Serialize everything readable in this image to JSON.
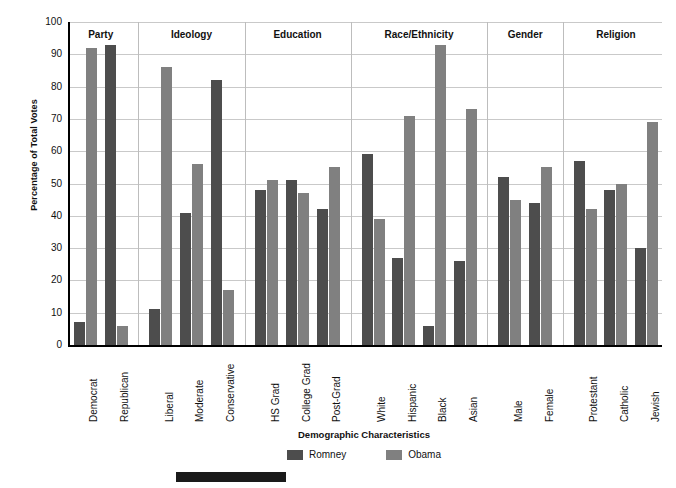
{
  "chart_data": {
    "type": "bar",
    "title": "",
    "xlabel": "Demographic Characteristics",
    "ylabel": "Percentage of Total Votes",
    "ylim": [
      0,
      100
    ],
    "ytick_step": 10,
    "yticks": [
      100,
      90,
      80,
      70,
      60,
      50,
      40,
      30,
      20,
      10,
      0
    ],
    "grid": true,
    "legend_position": "bottom-center",
    "series": [
      {
        "name": "Romney",
        "color": "#4d4d4d",
        "values": [
          7,
          93,
          11,
          41,
          82,
          48,
          51,
          42,
          59,
          27,
          6,
          26,
          52,
          44,
          57,
          48,
          30
        ]
      },
      {
        "name": "Obama",
        "color": "#808080",
        "values": [
          92,
          6,
          86,
          56,
          17,
          51,
          47,
          55,
          39,
          71,
          93,
          73,
          45,
          55,
          42,
          50,
          69
        ]
      }
    ],
    "categories": [
      "Democrat",
      "Republican",
      "Liberal",
      "Moderate",
      "Conservative",
      "HS Grad",
      "College Grad",
      "Post-Grad",
      "White",
      "Hispanic",
      "Black",
      "Asian",
      "Male",
      "Female",
      "Protestant",
      "Catholic",
      "Jewish"
    ],
    "groups": [
      {
        "label": "Party",
        "categories": [
          "Democrat",
          "Republican"
        ]
      },
      {
        "label": "Ideology",
        "categories": [
          "Liberal",
          "Moderate",
          "Conservative"
        ]
      },
      {
        "label": "Education",
        "categories": [
          "HS Grad",
          "College Grad",
          "Post-Grad"
        ]
      },
      {
        "label": "Race/Ethnicity",
        "categories": [
          "White",
          "Hispanic",
          "Black",
          "Asian"
        ]
      },
      {
        "label": "Gender",
        "categories": [
          "Male",
          "Female"
        ]
      },
      {
        "label": "Religion",
        "categories": [
          "Protestant",
          "Catholic",
          "Jewish"
        ]
      }
    ],
    "points": [
      {
        "group": "Party",
        "category": "Democrat",
        "Romney": 7,
        "Obama": 92
      },
      {
        "group": "Party",
        "category": "Republican",
        "Romney": 93,
        "Obama": 6
      },
      {
        "group": "Ideology",
        "category": "Liberal",
        "Romney": 11,
        "Obama": 86
      },
      {
        "group": "Ideology",
        "category": "Moderate",
        "Romney": 41,
        "Obama": 56
      },
      {
        "group": "Ideology",
        "category": "Conservative",
        "Romney": 82,
        "Obama": 17
      },
      {
        "group": "Education",
        "category": "HS Grad",
        "Romney": 48,
        "Obama": 51
      },
      {
        "group": "Education",
        "category": "College Grad",
        "Romney": 51,
        "Obama": 47
      },
      {
        "group": "Education",
        "category": "Post-Grad",
        "Romney": 42,
        "Obama": 55
      },
      {
        "group": "Race/Ethnicity",
        "category": "White",
        "Romney": 59,
        "Obama": 39
      },
      {
        "group": "Race/Ethnicity",
        "category": "Hispanic",
        "Romney": 27,
        "Obama": 71
      },
      {
        "group": "Race/Ethnicity",
        "category": "Black",
        "Romney": 6,
        "Obama": 93
      },
      {
        "group": "Race/Ethnicity",
        "category": "Asian",
        "Romney": 26,
        "Obama": 73
      },
      {
        "group": "Gender",
        "category": "Male",
        "Romney": 52,
        "Obama": 45
      },
      {
        "group": "Gender",
        "category": "Female",
        "Romney": 44,
        "Obama": 55
      },
      {
        "group": "Religion",
        "category": "Protestant",
        "Romney": 57,
        "Obama": 42
      },
      {
        "group": "Religion",
        "category": "Catholic",
        "Romney": 48,
        "Obama": 50
      },
      {
        "group": "Religion",
        "category": "Jewish",
        "Romney": 30,
        "Obama": 69
      }
    ]
  },
  "legend": {
    "items": [
      {
        "label": "Romney",
        "color": "#4d4d4d"
      },
      {
        "label": "Obama",
        "color": "#808080"
      }
    ]
  },
  "axes": {
    "y_title": "Percentage of Total Votes",
    "x_title": "Demographic Characteristics"
  }
}
